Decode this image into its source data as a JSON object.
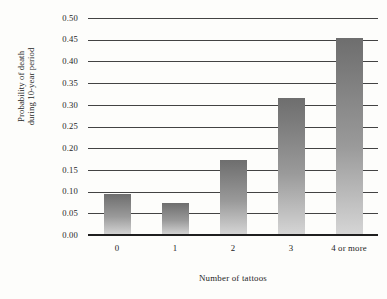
{
  "chart_data": {
    "type": "bar",
    "title": "",
    "xlabel": "Number of tattoos",
    "ylabel_lines": [
      "Probability of death",
      "during 10-year period"
    ],
    "ylabel": "Probability of death during 10-year period",
    "categories": [
      "0",
      "1",
      "2",
      "3",
      "4 or more"
    ],
    "values": [
      0.095,
      0.073,
      0.173,
      0.315,
      0.454
    ],
    "ylim": [
      0.0,
      0.5
    ],
    "ytick_labels": [
      "0.00",
      "0.05",
      "0.10",
      "0.15",
      "0.20",
      "0.25",
      "0.30",
      "0.35",
      "0.40",
      "0.45",
      "0.50"
    ],
    "ytick_values": [
      0.0,
      0.05,
      0.1,
      0.15,
      0.2,
      0.25,
      0.3,
      0.35,
      0.4,
      0.45,
      0.5
    ],
    "grid": "horizontal",
    "legend": "none",
    "bar_fill_top_color": "#6e6e6e",
    "bar_fill_bottom_color": "#d6d6d6",
    "gridline_color": "#434343",
    "axis_color": "#1f1f1f",
    "background_color": "#fdfdfb",
    "text_color": "#242424"
  }
}
